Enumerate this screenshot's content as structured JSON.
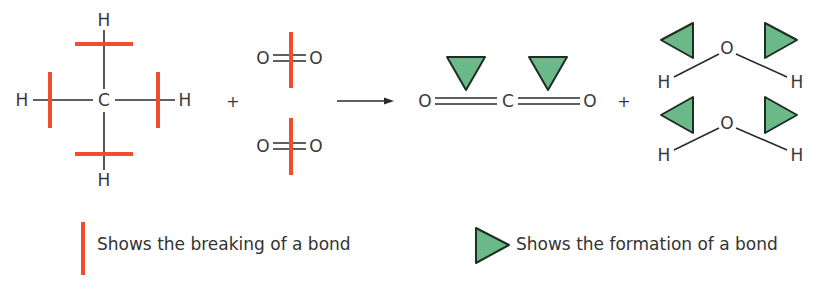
{
  "colors": {
    "break_bar": "#f04e2e",
    "form_fill": "#6bb888",
    "form_stroke": "#1e2e22",
    "bond": "#2b2b2b",
    "text": "#3a3a3a"
  },
  "reactants": {
    "methane": {
      "center": "C",
      "top": "H",
      "bottom": "H",
      "left": "H",
      "right": "H"
    },
    "plus": "+",
    "oxygen_1": {
      "left": "O",
      "right": "O"
    },
    "oxygen_2": {
      "left": "O",
      "right": "O"
    }
  },
  "arrow_label": "",
  "products": {
    "carbon_dioxide": {
      "left": "O",
      "center": "C",
      "right": "O"
    },
    "plus": "+",
    "water_1": {
      "center": "O",
      "left": "H",
      "right": "H"
    },
    "water_2": {
      "center": "O",
      "left": "H",
      "right": "H"
    }
  },
  "legend": {
    "break_label": "Shows the breaking of a bond",
    "form_label": "Shows the formation of a bond"
  }
}
